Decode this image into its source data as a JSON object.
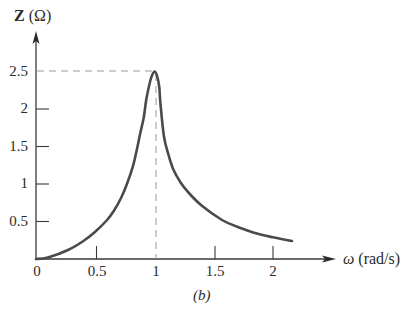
{
  "chart_data": {
    "type": "line",
    "title": "",
    "caption": "(b)",
    "xlabel": "ω (rad/s)",
    "ylabel": "Z (Ω)",
    "xlim": [
      0,
      2.3
    ],
    "ylim": [
      0,
      2.6
    ],
    "grid": false,
    "legend": null,
    "x_ticks": [
      "0",
      "0.5",
      "1",
      "1.5",
      "2"
    ],
    "y_ticks": [
      "0.5",
      "1",
      "1.5",
      "2",
      "2.5"
    ],
    "annotations": [
      {
        "type": "dashed-line",
        "description": "horizontal guide at Z = 2.5 from y-axis to peak"
      },
      {
        "type": "dashed-line",
        "description": "vertical guide at ω = 1 from peak to x-axis"
      }
    ],
    "series": [
      {
        "name": "Z(ω)",
        "x": [
          0.0,
          0.1,
          0.27,
          0.4,
          0.49,
          0.6,
          0.66,
          0.72,
          0.77,
          0.82,
          0.85,
          0.88,
          0.91,
          0.93,
          0.96,
          0.98,
          1.0,
          1.02,
          1.04,
          1.05,
          1.08,
          1.12,
          1.16,
          1.22,
          1.29,
          1.4,
          1.57,
          1.7,
          1.84,
          2.0,
          2.16
        ],
        "values": [
          0.0,
          0.02,
          0.12,
          0.24,
          0.35,
          0.52,
          0.65,
          0.82,
          1.01,
          1.25,
          1.45,
          1.68,
          1.89,
          2.12,
          2.35,
          2.45,
          2.5,
          2.45,
          2.3,
          2.08,
          1.63,
          1.38,
          1.19,
          1.02,
          0.88,
          0.71,
          0.52,
          0.43,
          0.35,
          0.29,
          0.24
        ]
      }
    ]
  },
  "labels": {
    "ylabel_symbol": "Z",
    "ylabel_unit": "(Ω)",
    "xlabel_symbol": "ω",
    "xlabel_unit": "(rad/s)",
    "caption": "(b)",
    "x_ticks": [
      "0",
      "0.5",
      "1",
      "1.5",
      "2"
    ],
    "y_ticks": [
      "0.5",
      "1",
      "1.5",
      "2",
      "2.5"
    ]
  },
  "colors": {
    "curve": "#4a4a4a",
    "axis": "#3a3a3a",
    "guide": "#9a9a9a"
  }
}
